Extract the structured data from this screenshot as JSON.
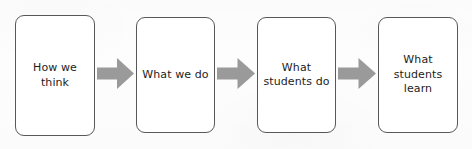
{
  "diagram": {
    "type": "process-flow",
    "orientation": "horizontal",
    "title": "",
    "background_color": "#fdfdfd",
    "box_border_color": "#585858",
    "box_fill_color": "#ffffff",
    "arrow_color": "#9a9a9a",
    "text_color": "#1d1d1d",
    "stages": [
      {
        "id": "stage-1",
        "label": "How we think",
        "lines": [
          "How we think"
        ],
        "x": 15,
        "y": 15,
        "width": 80,
        "height": 121
      },
      {
        "id": "stage-2",
        "label": "What we do",
        "lines": [
          "What we do"
        ],
        "x": 136,
        "y": 17,
        "width": 79,
        "height": 116
      },
      {
        "id": "stage-3",
        "label": "What\nstudents do",
        "lines": [
          "What",
          "students do"
        ],
        "x": 257,
        "y": 17,
        "width": 79,
        "height": 116
      },
      {
        "id": "stage-4",
        "label": "What\nstudents\nlearn",
        "lines": [
          "What",
          "students",
          "learn"
        ],
        "x": 378,
        "y": 17,
        "width": 80,
        "height": 116
      }
    ],
    "connectors": [
      {
        "id": "arrow-1",
        "from": "stage-1",
        "to": "stage-2",
        "x": 97,
        "y": 58,
        "width": 37,
        "height": 31
      },
      {
        "id": "arrow-2",
        "from": "stage-2",
        "to": "stage-3",
        "x": 217,
        "y": 58,
        "width": 38,
        "height": 31
      },
      {
        "id": "arrow-3",
        "from": "stage-3",
        "to": "stage-4",
        "x": 338,
        "y": 58,
        "width": 38,
        "height": 31
      }
    ]
  }
}
